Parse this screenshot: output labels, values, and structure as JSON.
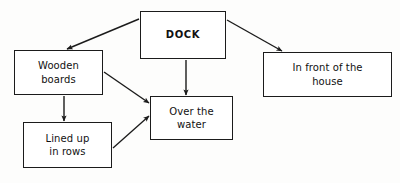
{
  "diagram": {
    "type": "concept-map",
    "topic": "DOCK",
    "canvas": {
      "width": 400,
      "height": 183,
      "background": "#fdfdfc"
    },
    "style": {
      "line_color": "#1b1b1b",
      "box_fill": "#ffffff",
      "text_color": "#111111"
    },
    "nodes": [
      {
        "id": "dock",
        "label": "DOCK",
        "role": "root",
        "x": 140,
        "y": 11,
        "w": 86,
        "h": 48
      },
      {
        "id": "wooden-boards",
        "label": "Wooden\nboards",
        "role": "attribute",
        "x": 14,
        "y": 50,
        "w": 89,
        "h": 45
      },
      {
        "id": "in-front-of-the-house",
        "label": "In front of the\nhouse",
        "role": "attribute",
        "x": 263,
        "y": 52,
        "w": 129,
        "h": 45
      },
      {
        "id": "over-the-water",
        "label": "Over the\nwater",
        "role": "attribute",
        "x": 150,
        "y": 96,
        "w": 83,
        "h": 44
      },
      {
        "id": "lined-up-in-rows",
        "label": "Lined up\nin rows",
        "role": "attribute",
        "x": 23,
        "y": 122,
        "w": 89,
        "h": 46
      }
    ],
    "edges": [
      {
        "id": "dock-to-wooden-boards",
        "from": "dock",
        "to": "wooden-boards",
        "x1": 139,
        "y1": 19,
        "x2": 67,
        "y2": 49,
        "arrow": "end"
      },
      {
        "id": "dock-to-in-front-of-the-house",
        "from": "dock",
        "to": "in-front-of-the-house",
        "x1": 227,
        "y1": 20,
        "x2": 282,
        "y2": 51,
        "arrow": "end"
      },
      {
        "id": "dock-to-over-the-water",
        "from": "dock",
        "to": "over-the-water",
        "x1": 186,
        "y1": 60,
        "x2": 186,
        "y2": 95,
        "arrow": "end"
      },
      {
        "id": "wooden-boards-to-over-the-water",
        "from": "wooden-boards",
        "to": "over-the-water",
        "x1": 104,
        "y1": 72,
        "x2": 149,
        "y2": 103,
        "arrow": "end"
      },
      {
        "id": "wooden-boards-to-lined-up-in-rows",
        "from": "wooden-boards",
        "to": "lined-up-in-rows",
        "x1": 64,
        "y1": 96,
        "x2": 64,
        "y2": 121,
        "arrow": "end"
      },
      {
        "id": "lined-up-in-rows-to-over-the-water",
        "from": "lined-up-in-rows",
        "to": "over-the-water",
        "x1": 113,
        "y1": 148,
        "x2": 149,
        "y2": 116,
        "arrow": "end"
      }
    ]
  }
}
